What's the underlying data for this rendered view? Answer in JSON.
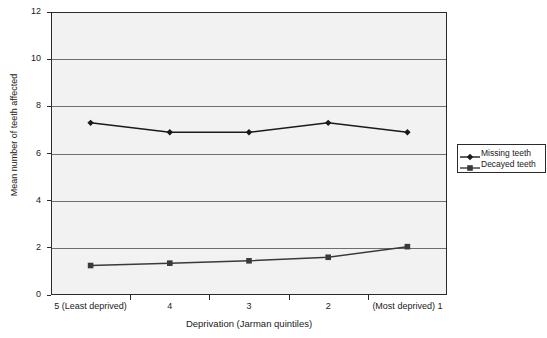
{
  "chart_data": {
    "type": "line",
    "title": "",
    "xlabel": "Deprivation (Jarman quintiles)",
    "ylabel": "Mean number of teeth affected",
    "categories": [
      "5 (Least deprived)",
      "4",
      "3",
      "2",
      "(Most deprived) 1"
    ],
    "ylim": [
      0,
      12
    ],
    "yticks": [
      0,
      2,
      4,
      6,
      8,
      10,
      12
    ],
    "ytick_labels": [
      "0",
      "2",
      "4",
      "6",
      "8",
      "10",
      "12"
    ],
    "grid": true,
    "legend_position": "right",
    "series": [
      {
        "name": "Missing teeth",
        "marker": "diamond",
        "color": "#1a1a1a",
        "values": [
          7.3,
          6.9,
          6.9,
          7.3,
          6.9
        ]
      },
      {
        "name": "Decayed teeth",
        "marker": "square",
        "color": "#3a3a3a",
        "values": [
          1.25,
          1.35,
          1.45,
          1.6,
          2.05
        ]
      }
    ]
  },
  "legend": {
    "entries": [
      {
        "label": "Missing teeth"
      },
      {
        "label": "Decayed teeth"
      }
    ]
  },
  "colors": {
    "plot_background": "#f2f2f2",
    "axis": "#2b2b2b",
    "gridline": "#6e6e6e",
    "text": "#1a1a1a"
  }
}
